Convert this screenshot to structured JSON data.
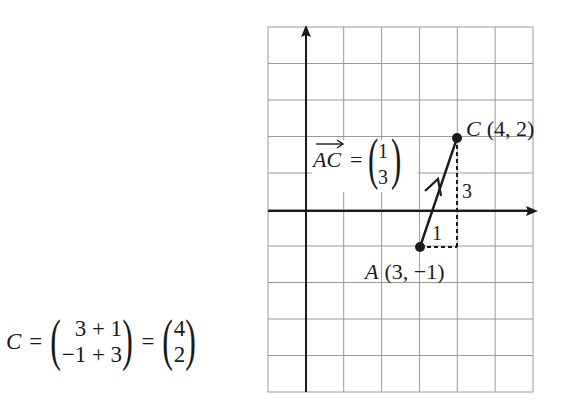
{
  "grid": {
    "cols": 7,
    "rows": 10,
    "left": 268,
    "top": 27,
    "right": 533,
    "bottom": 392,
    "origin_col": 1,
    "origin_row": 5,
    "line_color": "#9a9a9a",
    "axis_color": "#1a1a1a"
  },
  "points": {
    "A": {
      "label": "A",
      "coords": "(3, −1)",
      "x": 3,
      "y": -1
    },
    "C": {
      "label": "C",
      "coords": "(4, 2)",
      "x": 4,
      "y": 2
    }
  },
  "vector": {
    "name": "AC",
    "eq_sign": "=",
    "components": [
      "1",
      "3"
    ],
    "run_label": "1",
    "rise_label": "3"
  },
  "equation": {
    "lhs": "C",
    "eq1": "=",
    "col1_top": "3 + 1",
    "col1_bottom": "−1 + 3",
    "eq2": "=",
    "col2_top": "4",
    "col2_bottom": "2"
  }
}
